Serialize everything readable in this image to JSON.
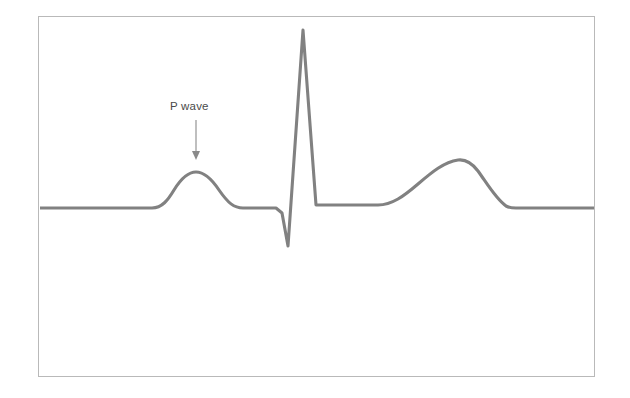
{
  "figure": {
    "kind": "ecg-waveform-diagram",
    "background_color": "#ffffff",
    "frame": {
      "border_color": "#b9b9b9",
      "x": 38,
      "y": 16,
      "width": 557,
      "height": 361
    }
  },
  "annotations": [
    {
      "id": "p-wave",
      "label": "P wave",
      "text_color": "#4a4a4a",
      "arrow_color": "#8a8a8a",
      "label_x": 170,
      "label_y": 99,
      "arrow_from_x": 196,
      "arrow_from_y": 120,
      "arrow_to_x": 196,
      "arrow_to_y": 160
    }
  ],
  "chart_data": {
    "type": "line",
    "title": "",
    "xlabel": "",
    "ylabel": "",
    "grid": false,
    "legend": null,
    "axes_visible": false,
    "xlim": [
      38,
      595
    ],
    "ylim": [
      377,
      16
    ],
    "series": [
      {
        "name": "ECG trace",
        "color": "#818181",
        "stroke_width": 3.1,
        "baseline_y": 208,
        "comment": "Single cardiac cycle: flat baseline, P wave, PR segment, QRS complex, ST segment, T wave, flat baseline.",
        "segments": [
          {
            "name": "baseline-left",
            "x_start": 40,
            "x_end": 158,
            "y": 208
          },
          {
            "name": "p-wave",
            "x_start": 158,
            "x_peak": 196,
            "x_end": 240,
            "y_peak": 172,
            "amplitude": 36
          },
          {
            "name": "pr-segment",
            "x_start": 240,
            "x_end": 276,
            "y": 208
          },
          {
            "name": "q-wave",
            "x_start": 276,
            "x_end": 288,
            "y_trough": 246
          },
          {
            "name": "r-wave",
            "x_start": 288,
            "x_peak": 303,
            "y_peak": 30,
            "amplitude": 178
          },
          {
            "name": "s-wave",
            "x_start": 303,
            "x_end": 316,
            "y_end": 205
          },
          {
            "name": "st-segment",
            "x_start": 316,
            "x_end": 378,
            "y": 205
          },
          {
            "name": "t-wave",
            "x_start": 378,
            "x_peak": 462,
            "x_end": 514,
            "y_peak": 160,
            "amplitude": 48
          },
          {
            "name": "baseline-right",
            "x_start": 514,
            "x_end": 594,
            "y": 208
          }
        ],
        "path": "M 40,208 L 152,208 C 162,208 168,200 174,190 C 182,177 189,172 196,172 C 204,172 211,178 219,190 C 228,203 234,208 243,208 L 276,208 L 282,213 L 288,246 L 303,30 L 316,205 L 378,205 C 392,205 404,196 418,184 C 432,172 444,162 458,160 C 466,159 472,163 478,171 C 488,185 496,199 506,206 C 510,208 512,208 516,208 L 594,208"
      }
    ]
  }
}
